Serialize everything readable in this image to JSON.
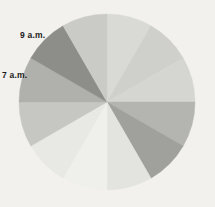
{
  "background_color": "#f2f1ee",
  "labels": [
    {
      "id": "9am",
      "text": "9 a.m.",
      "x": 20,
      "y": 31
    },
    {
      "id": "7am",
      "text": "7 a.m.",
      "x": 2,
      "y": 71
    }
  ],
  "chart_data": {
    "type": "pie",
    "title": "",
    "subtitle": "",
    "xlabel": "",
    "ylabel": "",
    "grid": false,
    "legend": "none",
    "center_x": 107,
    "center_y": 102,
    "radius": 88,
    "start_angle_deg": -90,
    "annotations": [
      "9 a.m.",
      "7 a.m."
    ],
    "categories": [
      "12 a.m.",
      "1 a.m.",
      "2 a.m.",
      "3 a.m.",
      "4 a.m.",
      "5 a.m.",
      "6 a.m.",
      "7 a.m.",
      "8 a.m.",
      "9 a.m.",
      "10 a.m.",
      "11 a.m."
    ],
    "values": [
      8.33,
      8.33,
      8.33,
      8.33,
      8.33,
      8.33,
      8.33,
      8.33,
      8.33,
      8.33,
      8.33,
      8.33
    ],
    "colors": [
      "#d9d9d5",
      "#cfcfcb",
      "#d5d5d1",
      "#b4b4b0",
      "#a0a09c",
      "#e3e3df",
      "#efefeb",
      "#e8e8e4",
      "#c6c6c2",
      "#b0b0ac",
      "#cacac6",
      "#8d8d89"
    ],
    "slices": [
      {
        "label": "12 a.m.",
        "value": 8.33,
        "start_deg": -90,
        "end_deg": -60,
        "color": "#d9d9d5"
      },
      {
        "label": "1 a.m.",
        "value": 8.33,
        "start_deg": -60,
        "end_deg": -30,
        "color": "#cfcfcb"
      },
      {
        "label": "2 a.m.",
        "value": 8.33,
        "start_deg": -30,
        "end_deg": 0,
        "color": "#d5d5d1"
      },
      {
        "label": "3 a.m.",
        "value": 8.33,
        "start_deg": 0,
        "end_deg": 30,
        "color": "#b4b4b0"
      },
      {
        "label": "4 a.m.",
        "value": 8.33,
        "start_deg": 30,
        "end_deg": 60,
        "color": "#a0a09c"
      },
      {
        "label": "5 a.m.",
        "value": 8.33,
        "start_deg": 60,
        "end_deg": 90,
        "color": "#e3e3df"
      },
      {
        "label": "6 a.m.",
        "value": 8.33,
        "start_deg": 90,
        "end_deg": 120,
        "color": "#efefeb"
      },
      {
        "label": "7 a.m.",
        "value": 8.33,
        "start_deg": 120,
        "end_deg": 150,
        "color": "#e8e8e4"
      },
      {
        "label": "8 a.m.",
        "value": 8.33,
        "start_deg": 150,
        "end_deg": 180,
        "color": "#c6c6c2"
      },
      {
        "label": "9 a.m.",
        "value": 8.33,
        "start_deg": 180,
        "end_deg": 210,
        "color": "#b0b0ac"
      },
      {
        "label": "10 a.m.",
        "value": 8.33,
        "start_deg": 210,
        "end_deg": 240,
        "color": "#8d8d89"
      },
      {
        "label": "11 a.m.",
        "value": 8.33,
        "start_deg": 240,
        "end_deg": 270,
        "color": "#cacac6"
      }
    ]
  }
}
